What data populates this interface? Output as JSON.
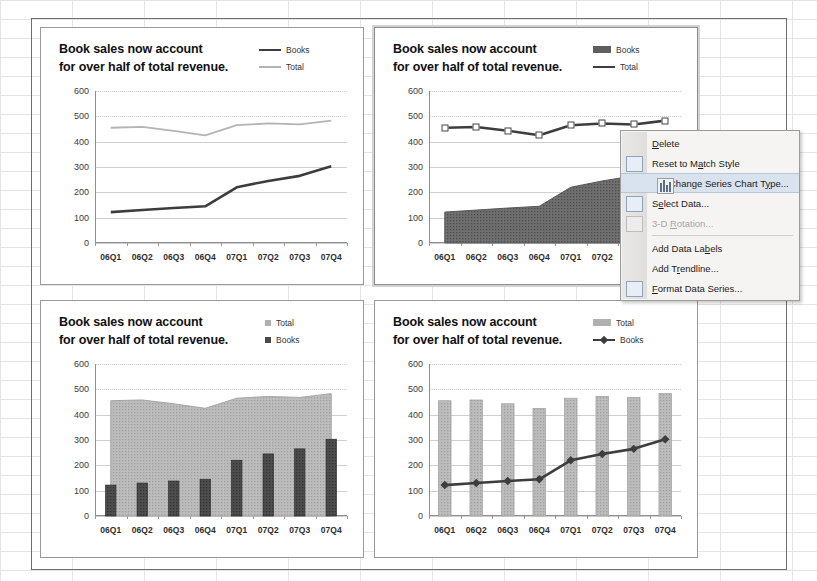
{
  "app": {
    "context": "excel-chart-sheet"
  },
  "charts": [
    {
      "id": "chart-line-line",
      "selected": false,
      "title_line1": "Book sales now account",
      "title_line2": "for over half of total revenue.",
      "legend": [
        {
          "label": "Books",
          "marker": "thick-line",
          "color": "#3d3d3d"
        },
        {
          "label": "Total",
          "marker": "thin-line",
          "color": "#b4b4b4"
        }
      ],
      "chart_data": {
        "type": "line",
        "title": "Book sales now account for over half of total revenue.",
        "categories": [
          "06Q1",
          "06Q2",
          "06Q3",
          "06Q4",
          "07Q1",
          "07Q2",
          "07Q3",
          "07Q4"
        ],
        "series": [
          {
            "name": "Books",
            "type": "line",
            "color": "#3d3d3d",
            "values": [
              122,
              130,
              138,
              145,
              220,
              245,
              265,
              303
            ]
          },
          {
            "name": "Total",
            "type": "line",
            "color": "#b4b4b4",
            "values": [
              455,
              458,
              443,
              425,
              465,
              472,
              468,
              483
            ]
          }
        ],
        "yticks": [
          0,
          100,
          200,
          300,
          400,
          500,
          600
        ],
        "ylim": [
          0,
          600
        ],
        "xlabel": "",
        "ylabel": "",
        "grid": true,
        "legend_position": "top-right"
      }
    },
    {
      "id": "chart-area-line-selected",
      "selected": true,
      "title_line1": "Book sales now account",
      "title_line2": "for over half of total revenue.",
      "legend": [
        {
          "label": "Books",
          "marker": "filled-box",
          "color": "#5f5f5f"
        },
        {
          "label": "Total",
          "marker": "thick-line",
          "color": "#3d3d3d"
        }
      ],
      "series_selected": "Total",
      "chart_data": {
        "type": "area",
        "title": "Book sales now account for over half of total revenue.",
        "categories": [
          "06Q1",
          "06Q2",
          "06Q3",
          "06Q4",
          "07Q1",
          "07Q2",
          "07Q3",
          "07Q4"
        ],
        "series": [
          {
            "name": "Books",
            "type": "area",
            "color": "#6b6b6b",
            "values": [
              122,
              130,
              138,
              145,
              220,
              245,
              265,
              303
            ]
          },
          {
            "name": "Total",
            "type": "line",
            "color": "#3d3d3d",
            "values": [
              455,
              458,
              443,
              425,
              465,
              472,
              468,
              483
            ]
          }
        ],
        "yticks": [
          0,
          100,
          200,
          300,
          400,
          500,
          600
        ],
        "ylim": [
          0,
          600
        ],
        "xlabel": "",
        "ylabel": "",
        "grid": true,
        "legend_position": "top-right"
      }
    },
    {
      "id": "chart-area-column",
      "selected": false,
      "title_line1": "Book sales now account",
      "title_line2": "for over half of total revenue.",
      "legend": [
        {
          "label": "Total",
          "marker": "small-square-light",
          "color": "#b0b0b0"
        },
        {
          "label": "Books",
          "marker": "small-square-dark",
          "color": "#4a4a4a"
        }
      ],
      "chart_data": {
        "type": "area",
        "title": "Book sales now account for over half of total revenue.",
        "categories": [
          "06Q1",
          "06Q2",
          "06Q3",
          "06Q4",
          "07Q1",
          "07Q2",
          "07Q3",
          "07Q4"
        ],
        "series": [
          {
            "name": "Total",
            "type": "area",
            "color": "#b4b4b4",
            "values": [
              455,
              458,
              443,
              425,
              465,
              472,
              468,
              483
            ]
          },
          {
            "name": "Books",
            "type": "bar",
            "color": "#4a4a4a",
            "values": [
              122,
              130,
              138,
              145,
              220,
              245,
              265,
              303
            ]
          }
        ],
        "yticks": [
          0,
          100,
          200,
          300,
          400,
          500,
          600
        ],
        "ylim": [
          0,
          600
        ],
        "xlabel": "",
        "ylabel": "",
        "grid": true,
        "legend_position": "top-right"
      }
    },
    {
      "id": "chart-column-line",
      "selected": false,
      "title_line1": "Book sales now account",
      "title_line2": "for over half of total revenue.",
      "legend": [
        {
          "label": "Total",
          "marker": "filled-box-light",
          "color": "#b0b0b0"
        },
        {
          "label": "Books",
          "marker": "line-with-marker",
          "color": "#3d3d3d"
        }
      ],
      "chart_data": {
        "type": "bar",
        "title": "Book sales now account for over half of total revenue.",
        "categories": [
          "06Q1",
          "06Q2",
          "06Q3",
          "06Q4",
          "07Q1",
          "07Q2",
          "07Q3",
          "07Q4"
        ],
        "series": [
          {
            "name": "Total",
            "type": "bar",
            "color": "#b4b4b4",
            "values": [
              455,
              458,
              443,
              425,
              465,
              472,
              468,
              483
            ]
          },
          {
            "name": "Books",
            "type": "line",
            "color": "#3d3d3d",
            "values": [
              122,
              130,
              138,
              145,
              220,
              245,
              265,
              303
            ]
          }
        ],
        "yticks": [
          0,
          100,
          200,
          300,
          400,
          500,
          600
        ],
        "ylim": [
          0,
          600
        ],
        "xlabel": "",
        "ylabel": "",
        "grid": true,
        "legend_position": "top-right"
      }
    }
  ],
  "context_menu": {
    "items": [
      {
        "label": "Delete",
        "accel": "D",
        "icon": "none",
        "state": "normal",
        "separator_after": false
      },
      {
        "label": "Reset to Match Style",
        "accel": "a",
        "icon": "reset-style-icon",
        "state": "normal",
        "separator_after": false
      },
      {
        "label": "Change Series Chart Type...",
        "accel": "y",
        "icon": "chart-type-icon",
        "state": "highlighted",
        "separator_after": false
      },
      {
        "label": "Select Data...",
        "accel": "e",
        "icon": "select-data-icon",
        "state": "normal",
        "separator_after": false
      },
      {
        "label": "3-D Rotation...",
        "accel": "R",
        "icon": "rotation-icon",
        "state": "disabled",
        "separator_after": true
      },
      {
        "label": "Add Data Labels",
        "accel": "b",
        "icon": "none",
        "state": "normal",
        "separator_after": false
      },
      {
        "label": "Add Trendline...",
        "accel": "r",
        "icon": "none",
        "state": "normal",
        "separator_after": false
      },
      {
        "label": "Format Data Series...",
        "accel": "F",
        "icon": "format-series-icon",
        "state": "normal",
        "separator_after": false
      }
    ]
  }
}
